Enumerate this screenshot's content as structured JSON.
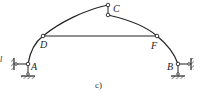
{
  "figure": {
    "caption": "c)",
    "stroke_color": "#222222",
    "background": "#ffffff"
  },
  "labels": {
    "A": "A",
    "B": "B",
    "C": "C",
    "D": "D",
    "F": "F",
    "edge_mark": "l"
  },
  "nodes": [
    {
      "id": "A",
      "x": 28,
      "y": 64,
      "type": "hinged-support"
    },
    {
      "id": "B",
      "x": 178,
      "y": 64,
      "type": "hinged-support"
    },
    {
      "id": "C",
      "x": 108,
      "y": 5,
      "type": "hinge"
    },
    {
      "id": "D",
      "x": 43,
      "y": 36,
      "type": "joint"
    },
    {
      "id": "F",
      "x": 157,
      "y": 36,
      "type": "joint"
    }
  ],
  "members": [
    {
      "from": "A",
      "to": "C",
      "type": "curved-arch"
    },
    {
      "from": "C",
      "to": "B",
      "type": "curved-arch"
    },
    {
      "from": "D",
      "to": "F",
      "type": "tie-rod"
    }
  ]
}
